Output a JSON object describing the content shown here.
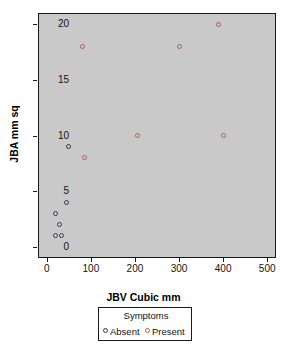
{
  "chart_data": {
    "type": "scatter",
    "title": "",
    "xlabel": "JBV Cubic mm",
    "ylabel": "JBA mm sq",
    "xlim": [
      -20,
      520
    ],
    "ylim": [
      -1,
      21
    ],
    "xticks": [
      0,
      100,
      200,
      300,
      400,
      500
    ],
    "yticks": [
      0,
      5,
      10,
      15,
      20
    ],
    "xtick_labels": [
      "0",
      "100",
      "200",
      "300",
      "400",
      "500"
    ],
    "ytick_labels": [
      "0",
      "5",
      "10",
      "15",
      "20"
    ],
    "grid": false,
    "panel_background": "#c9c9c9",
    "legend": {
      "title": "Symptoms",
      "position": "below-plot",
      "entries": [
        {
          "label": "Absent",
          "color": "#3a3a4a",
          "marker": "open-circle"
        },
        {
          "label": "Present",
          "color": "#b35a55",
          "marker": "open-circle"
        }
      ]
    },
    "series": [
      {
        "name": "Absent",
        "color": "#3a3a4a",
        "marker": "open-circle",
        "points": [
          {
            "x": 50,
            "y": 9
          },
          {
            "x": 45,
            "y": 4
          },
          {
            "x": 20,
            "y": 3
          },
          {
            "x": 28,
            "y": 2
          },
          {
            "x": 20,
            "y": 1
          },
          {
            "x": 33,
            "y": 1
          }
        ]
      },
      {
        "name": "Present",
        "color": "#b35a55",
        "marker": "open-circle",
        "points": [
          {
            "x": 390,
            "y": 20
          },
          {
            "x": 80,
            "y": 18
          },
          {
            "x": 300,
            "y": 18
          },
          {
            "x": 205,
            "y": 10
          },
          {
            "x": 400,
            "y": 10
          },
          {
            "x": 85,
            "y": 8
          }
        ]
      }
    ]
  }
}
